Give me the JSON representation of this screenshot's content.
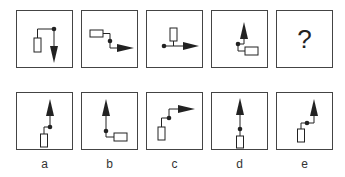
{
  "puzzle": {
    "sequence": [
      {
        "id": "1",
        "desc": "rectangle left, line up then right to dot, arrow pointing down"
      },
      {
        "id": "2",
        "desc": "rectangle top-left, line right then down to dot, arrow pointing right"
      },
      {
        "id": "3",
        "desc": "dot left, horizontal line with rectangle above, arrow pointing right"
      },
      {
        "id": "4",
        "desc": "arrow pointing up, dot, rectangle bottom-right"
      },
      {
        "id": "5",
        "question_mark": "?"
      }
    ],
    "options": [
      {
        "label": "a",
        "desc": "arrow up, dot, rectangle bottom-left"
      },
      {
        "label": "b",
        "desc": "arrow up, dot, rectangle bottom-right"
      },
      {
        "label": "c",
        "desc": "rectangle bottom-left, dot, arrow pointing right"
      },
      {
        "label": "d",
        "desc": "arrow up, dot, rectangle below"
      },
      {
        "label": "e",
        "desc": "rectangle bottom-left, dot, arrow up at right"
      }
    ]
  },
  "colors": {
    "stroke": "#222222",
    "border": "#444444"
  }
}
